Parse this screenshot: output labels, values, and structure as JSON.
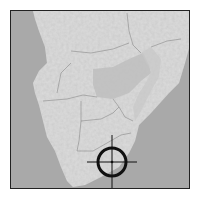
{
  "map": {
    "type": "locator-map",
    "region": "Southern Africa",
    "style": "grayscale shaded relief",
    "colors": {
      "ocean": "#a9a9a9",
      "land": "#dcdcdc",
      "highlight_region": "#b8b8b8",
      "border_lines": "#8a8a8a",
      "frame": "#222222",
      "marker": "#111111"
    },
    "marker": {
      "icon": "crosshair-target-icon",
      "cx": 111,
      "cy": 161,
      "radius": 14
    }
  }
}
